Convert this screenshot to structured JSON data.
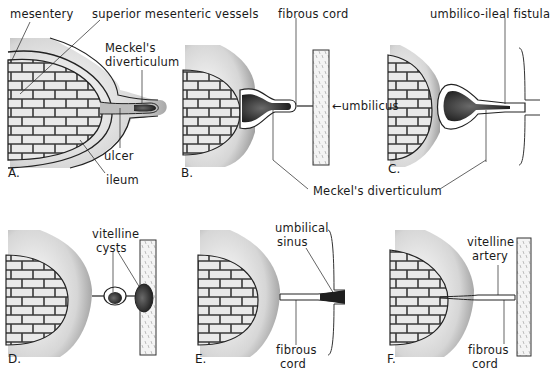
{
  "figure": {
    "panels": [
      {
        "id": "A",
        "label": "A."
      },
      {
        "id": "B",
        "label": "B."
      },
      {
        "id": "C",
        "label": "C."
      },
      {
        "id": "D",
        "label": "D."
      },
      {
        "id": "E",
        "label": "E."
      },
      {
        "id": "F",
        "label": "F."
      }
    ],
    "labels": {
      "mesentery": "mesentery",
      "superior_mesenteric_vessels": "superior mesenteric vessels",
      "meckels_diverticulum_a_line1": "Meckel's",
      "meckels_diverticulum_a_line2": "diverticulum",
      "ulcer": "ulcer",
      "ileum": "ileum",
      "fibrous_cord_b": "fibrous cord",
      "umbilicus": "umbilicus",
      "umbilico_ileal_fistula": "umbilico-ileal fistula",
      "meckels_diverticulum_shared": "Meckel's diverticulum",
      "vitelline_cysts_line1": "vitelline",
      "vitelline_cysts_line2": "cysts",
      "umbilical_sinus_line1": "umbilical",
      "umbilical_sinus_line2": "sinus",
      "fibrous_cord_e_line1": "fibrous",
      "fibrous_cord_e_line2": "cord",
      "vitelline_artery_line1": "vitelline",
      "vitelline_artery_line2": "artery",
      "fibrous_cord_f_line1": "fibrous",
      "fibrous_cord_f_line2": "cord"
    },
    "colors": {
      "ink": "#1a1a1a",
      "stipple": "#7a7a7a",
      "mesentery_fill": "#e6e6e6",
      "background": "#ffffff"
    }
  }
}
